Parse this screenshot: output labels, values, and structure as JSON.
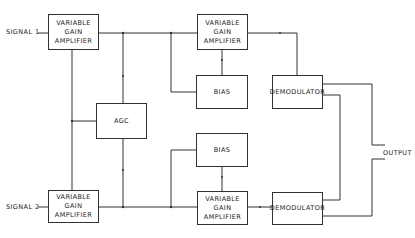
{
  "diagram": {
    "inputs": [
      {
        "label": "SIGNAL 1"
      },
      {
        "label": "SIGNAL 2"
      }
    ],
    "output": {
      "label": "OUTPUT"
    },
    "blocks": {
      "vga1_in": {
        "line1": "VARIABLE",
        "line2": "GAIN AMPLIFIER"
      },
      "vga1_out": {
        "line1": "VARIABLE",
        "line2": "GAIN AMPLIFIER"
      },
      "vga2_in": {
        "line1": "VARIABLE",
        "line2": "GAIN AMPLIFIER"
      },
      "vga2_out": {
        "line1": "VARIABLE",
        "line2": "GAIN AMPLIFIER"
      },
      "bias1": {
        "label": "BIAS"
      },
      "bias2": {
        "label": "BIAS"
      },
      "agc": {
        "label": "AGC"
      },
      "demod1": {
        "label": "DEMODULATOR"
      },
      "demod2": {
        "label": "DEMODULATOR"
      }
    },
    "line_color": "#333333"
  }
}
